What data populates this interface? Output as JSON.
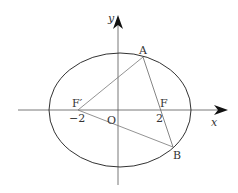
{
  "figure": {
    "type": "ellipse-focal-triangle",
    "axes": {
      "x_label": "x",
      "y_label": "y",
      "origin_label": "O"
    },
    "points": {
      "A": {
        "label": "A"
      },
      "B": {
        "label": "B"
      },
      "F": {
        "label": "F",
        "tick": "2"
      },
      "F_prime": {
        "label": "F′",
        "tick": "−2"
      }
    },
    "segments": [
      "F′A",
      "AB",
      "F′B"
    ],
    "colors": {
      "ellipse": "#333333",
      "lines": "#555555",
      "axes": "#444444",
      "text": "#333333"
    }
  }
}
